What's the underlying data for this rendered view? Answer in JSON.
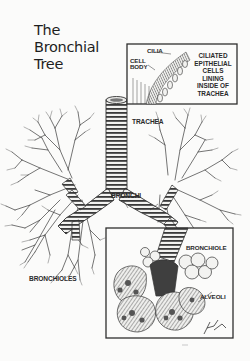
{
  "title": {
    "lines": [
      "The",
      "Bronchial",
      "Tree"
    ]
  },
  "top_inset": {
    "labels": {
      "cilia": "CILIA",
      "cell_body_line1": "CELL",
      "cell_body_line2": "BODY"
    },
    "caption_lines": [
      "CILIATED",
      "EPITHELIAL",
      "CELLS",
      "LINING",
      "INSIDE OF",
      "TRACHEA"
    ]
  },
  "main_labels": {
    "trachea": "TRACHEA",
    "bronchi": "BRONCHI",
    "bronchioles": "BRONCHIOLES"
  },
  "bottom_inset": {
    "labels": {
      "bronchiole": "BRONCHIOLE",
      "alveoli": "ALVEOLI"
    },
    "signature": "Frett '96"
  },
  "colors": {
    "ink": "#2a2a2a",
    "paper": "#fbfbfa",
    "frame": "#3a3a3a"
  }
}
